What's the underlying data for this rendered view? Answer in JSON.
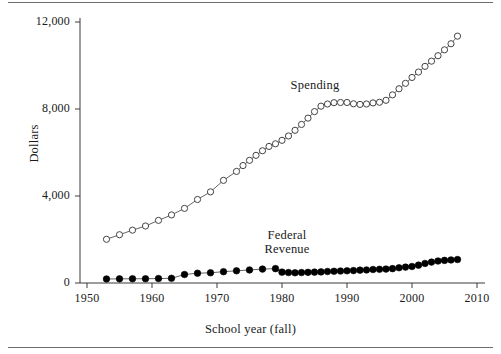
{
  "figure": {
    "y_axis_title": "Dollars",
    "x_axis_title": "School year (fall)",
    "spending_label": "Spending",
    "revenue_label": "Federal\nRevenue",
    "colors": {
      "axis": "#3a3a3a",
      "spending_marker_fill": "#ffffff",
      "spending_marker_stroke": "#444444",
      "revenue_marker_fill": "#000000",
      "line": "#555555",
      "rule": "#6e6e6e"
    }
  },
  "chart_data": {
    "type": "line",
    "title": "",
    "subtitle": "",
    "xlabel": "School year (fall)",
    "ylabel": "Dollars",
    "xlim": [
      1948,
      2012
    ],
    "ylim": [
      0,
      12800
    ],
    "xticks": [
      1950,
      1960,
      1970,
      1980,
      1990,
      2000,
      2010
    ],
    "xticklabels": [
      "1950",
      "1960",
      "1970",
      "1980",
      "1990",
      "2000",
      "2010"
    ],
    "yticks": [
      0,
      4000,
      8000,
      12000
    ],
    "yticklabels": [
      "0",
      "4,000",
      "8,000",
      "12,000"
    ],
    "grid": false,
    "legend": "inline-annotations",
    "annotations": [
      {
        "text": "Spending",
        "x": 1995,
        "ytext": 9400
      },
      {
        "text": "Federal Revenue",
        "x": 1982,
        "ytext": 2650
      }
    ],
    "series": [
      {
        "name": "Spending",
        "marker": "open-circle",
        "x": [
          1953,
          1955,
          1957,
          1959,
          1961,
          1963,
          1965,
          1967,
          1969,
          1971,
          1973,
          1974,
          1975,
          1976,
          1977,
          1978,
          1979,
          1980,
          1981,
          1982,
          1983,
          1984,
          1985,
          1986,
          1987,
          1988,
          1989,
          1990,
          1991,
          1992,
          1993,
          1994,
          1995,
          1996,
          1997,
          1998,
          1999,
          2000,
          2001,
          2002,
          2003,
          2004,
          2005,
          2006,
          2007
        ],
        "values": [
          2010,
          2220,
          2430,
          2620,
          2880,
          3130,
          3430,
          3840,
          4190,
          4720,
          5130,
          5400,
          5640,
          5870,
          6080,
          6280,
          6400,
          6560,
          6760,
          7020,
          7290,
          7580,
          7880,
          8130,
          8230,
          8290,
          8300,
          8300,
          8240,
          8210,
          8230,
          8280,
          8310,
          8400,
          8650,
          8930,
          9180,
          9450,
          9700,
          9960,
          10200,
          10450,
          10720,
          11000,
          11350
        ]
      },
      {
        "name": "Federal Revenue",
        "marker": "filled-circle",
        "x": [
          1953,
          1955,
          1957,
          1959,
          1961,
          1963,
          1965,
          1967,
          1969,
          1971,
          1973,
          1975,
          1977,
          1979,
          1980,
          1981,
          1982,
          1983,
          1984,
          1985,
          1986,
          1987,
          1988,
          1989,
          1990,
          1991,
          1992,
          1993,
          1994,
          1995,
          1996,
          1997,
          1998,
          1999,
          2000,
          2001,
          2002,
          2003,
          2004,
          2005,
          2006,
          2007
        ],
        "values": [
          185,
          190,
          195,
          195,
          205,
          215,
          390,
          450,
          470,
          520,
          560,
          600,
          640,
          660,
          500,
          480,
          470,
          480,
          490,
          500,
          510,
          530,
          540,
          550,
          560,
          570,
          590,
          600,
          620,
          630,
          640,
          660,
          700,
          730,
          760,
          820,
          900,
          960,
          1010,
          1040,
          1060,
          1080
        ]
      }
    ]
  }
}
